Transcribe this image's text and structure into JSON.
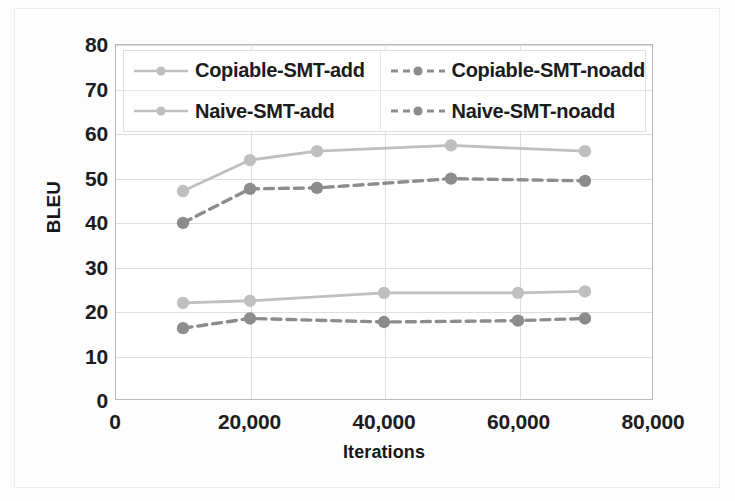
{
  "chart_data": {
    "type": "line",
    "title": "",
    "xlabel": "Iterations",
    "ylabel": "BLEU",
    "xlim": [
      0,
      80000
    ],
    "ylim": [
      0,
      80
    ],
    "xticks": [
      "0",
      "20,000",
      "40,000",
      "60,000",
      "80,000"
    ],
    "xtick_values": [
      0,
      20000,
      40000,
      60000,
      80000
    ],
    "yticks": [
      "0",
      "10",
      "20",
      "30",
      "40",
      "50",
      "60",
      "70",
      "80"
    ],
    "ytick_values": [
      0,
      10,
      20,
      30,
      40,
      50,
      60,
      70,
      80
    ],
    "grid": true,
    "legend_position": "top-inside",
    "series": [
      {
        "name": "Copiable-SMT-add",
        "color": "#bfbfbf",
        "style": "solid",
        "marker": "circle",
        "x": [
          10000,
          20000,
          30000,
          50000,
          70000
        ],
        "values": [
          47.0,
          54.0,
          56.0,
          57.3,
          56.0
        ]
      },
      {
        "name": "Copiable-SMT-noadd",
        "color": "#8c8c8c",
        "style": "dashed",
        "marker": "circle",
        "x": [
          10000,
          20000,
          30000,
          50000,
          70000
        ],
        "values": [
          39.8,
          47.5,
          47.7,
          49.8,
          49.3
        ]
      },
      {
        "name": "Naive-SMT-add",
        "color": "#bfbfbf",
        "style": "solid",
        "marker": "circle",
        "x": [
          10000,
          20000,
          40000,
          60000,
          70000
        ],
        "values": [
          21.7,
          22.2,
          24.0,
          24.0,
          24.3
        ]
      },
      {
        "name": "Naive-SMT-noadd",
        "color": "#8c8c8c",
        "style": "dashed",
        "marker": "circle",
        "x": [
          10000,
          20000,
          40000,
          60000,
          70000
        ],
        "values": [
          16.0,
          18.2,
          17.4,
          17.7,
          18.2
        ]
      }
    ]
  },
  "legend": {
    "entries": [
      {
        "label": "Copiable-SMT-add"
      },
      {
        "label": "Copiable-SMT-noadd"
      },
      {
        "label": "Naive-SMT-add"
      },
      {
        "label": "Naive-SMT-noadd"
      }
    ]
  },
  "axes": {
    "y_title": "BLEU",
    "x_title": "Iterations"
  }
}
